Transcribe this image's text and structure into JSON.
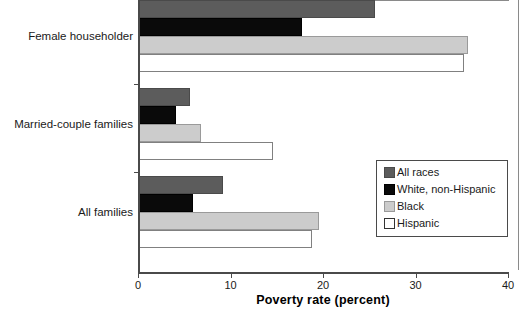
{
  "chart_data": {
    "type": "bar",
    "orientation": "horizontal",
    "title": "",
    "xlabel": "Poverty rate (percent)",
    "ylabel": "",
    "xlim": [
      0,
      40
    ],
    "xticks": [
      0,
      10,
      20,
      30,
      40
    ],
    "xtick_labels": [
      "0",
      "10",
      "20",
      "30",
      "40"
    ],
    "grid": false,
    "legend_position": "center-right",
    "categories": [
      "All families",
      "Married-couple families",
      "Female householder"
    ],
    "series": [
      {
        "name": "All races",
        "color": "#5c5c5c",
        "values": [
          9.2,
          5.6,
          25.6
        ]
      },
      {
        "name": "White, non-Hispanic",
        "color": "#0a0a0a",
        "values": [
          5.9,
          4.1,
          17.7
        ]
      },
      {
        "name": "Black",
        "color": "#cccccc",
        "values": [
          19.6,
          6.8,
          35.7
        ]
      },
      {
        "name": "Hispanic",
        "color": "#ffffff",
        "values": [
          18.8,
          14.6,
          35.2
        ]
      }
    ]
  },
  "axis": {
    "x_title": "Poverty rate (percent)",
    "tick_0": "0",
    "tick_1": "10",
    "tick_2": "20",
    "tick_3": "30",
    "tick_4": "40"
  },
  "categories": {
    "cat_0": "Female householder",
    "cat_1": "Married-couple families",
    "cat_2": "All families"
  },
  "legend": {
    "items": [
      {
        "label": "All races"
      },
      {
        "label": "White, non-Hispanic"
      },
      {
        "label": "Black"
      },
      {
        "label": "Hispanic"
      }
    ]
  }
}
